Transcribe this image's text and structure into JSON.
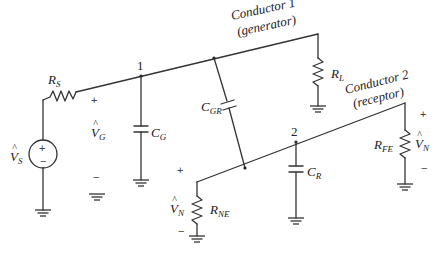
{
  "figure": {
    "type": "circuit-schematic"
  },
  "conductors": {
    "generator": {
      "name": "Conductor 1",
      "role": "(generator)"
    },
    "receptor": {
      "name": "Conductor 2",
      "role": "(receptor)"
    }
  },
  "nodes": {
    "node1": "1",
    "node2": "2"
  },
  "components": {
    "source": {
      "label": "V",
      "hat": "^",
      "sub": "S",
      "plus": "+",
      "minus": "−"
    },
    "rs": {
      "label": "R",
      "sub": "S"
    },
    "rl": {
      "label": "R",
      "sub": "L"
    },
    "cg": {
      "label": "C",
      "sub": "G"
    },
    "cgr": {
      "label": "C",
      "sub": "GR"
    },
    "cr": {
      "label": "C",
      "sub": "R"
    },
    "rne": {
      "label": "R",
      "sub": "NE"
    },
    "rfe": {
      "label": "R",
      "sub": "FE"
    }
  },
  "voltages": {
    "vg": {
      "label": "V",
      "hat": "^",
      "sub": "G",
      "plus": "+",
      "minus": "−"
    },
    "vne": {
      "label": "V",
      "hat": "^",
      "sub": "N",
      "plus": "+",
      "minus": "−"
    },
    "vfe": {
      "label": "V",
      "hat": "^",
      "sub": "N",
      "plus": "+",
      "minus": "−"
    }
  },
  "colors": {
    "wire": "#333333",
    "text": "#222222",
    "background": "#ffffff"
  }
}
